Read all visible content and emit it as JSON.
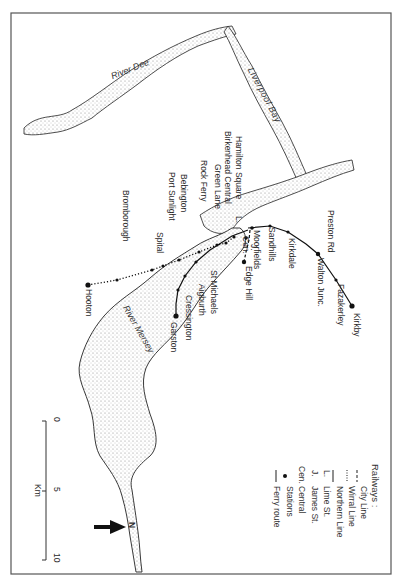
{
  "map": {
    "orientation": "rotated 90deg clockwise (north points right)",
    "water_labels": {
      "dee": "River Dee",
      "bay": "Liverpool Bay",
      "mersey": "River Mersey"
    },
    "stations": {
      "wirral": [
        "Hooton",
        "Bromborough",
        "Spital",
        "Port Sunlight",
        "Bebington",
        "Rock Ferry",
        "Green Lane",
        "Birkenhead Central",
        "Hamilton Square"
      ],
      "northern": [
        "Moorfields",
        "Sandhills",
        "Kirkdale",
        "Preston Rd",
        "Walton Junc.",
        "Fazakerley",
        "Kirkby"
      ],
      "city": [
        "Edge Hill"
      ],
      "south": [
        "St Michaels",
        "Aigburth",
        "Cressington",
        "Garston"
      ],
      "central_abbrev": [
        "L.",
        "J.",
        "Cen."
      ]
    },
    "scale": {
      "ticks": [
        "0",
        "5",
        "10"
      ],
      "unit": "Km"
    },
    "north_arrow": "N",
    "legend": {
      "title": "Railways :",
      "items": [
        {
          "symbol": "---",
          "label": "City Line"
        },
        {
          "symbol": "......",
          "label": "Wirral Line"
        },
        {
          "symbol": "——",
          "label": "Northern Line"
        },
        {
          "symbol": "L.",
          "label": "Lime St."
        },
        {
          "symbol": "J.",
          "label": "James St."
        },
        {
          "symbol": "Cen.",
          "label": "Central"
        },
        {
          "symbol": "•",
          "label": "Stations"
        },
        {
          "symbol": "—",
          "label": "Ferry route"
        }
      ]
    },
    "colors": {
      "line": "#1a1a1a",
      "water_stipple": "#9a9a9a",
      "frame": "#555555"
    }
  }
}
